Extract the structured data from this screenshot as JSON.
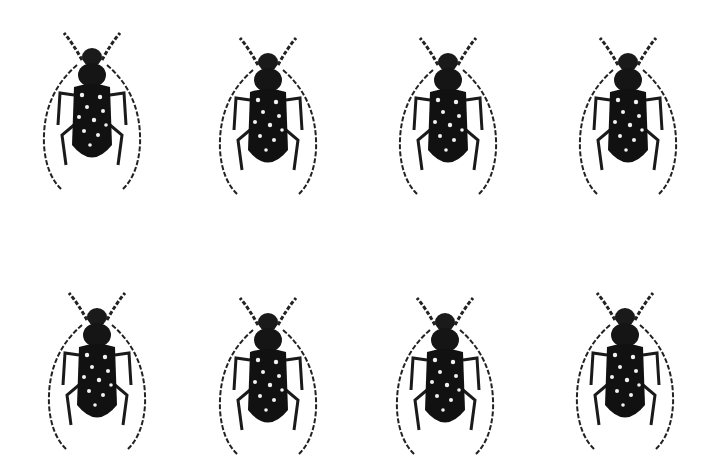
{
  "image": {
    "background": "#ffffff",
    "subject": "beetle specimens, dorsal view, black with white spots, long banded antennae",
    "layout": {
      "rows": 2,
      "columns": 4
    },
    "colors": {
      "body": "#111111",
      "spots": "#f2f2f2",
      "antenna": "#222222"
    }
  },
  "specimens": [
    {
      "row": 1,
      "col": 1,
      "x": 32,
      "y": 25
    },
    {
      "row": 1,
      "col": 2,
      "x": 208,
      "y": 30
    },
    {
      "row": 1,
      "col": 3,
      "x": 388,
      "y": 30
    },
    {
      "row": 1,
      "col": 4,
      "x": 568,
      "y": 30
    },
    {
      "row": 2,
      "col": 1,
      "x": 37,
      "y": 285
    },
    {
      "row": 2,
      "col": 2,
      "x": 208,
      "y": 290
    },
    {
      "row": 2,
      "col": 3,
      "x": 385,
      "y": 290
    },
    {
      "row": 2,
      "col": 4,
      "x": 565,
      "y": 285
    }
  ]
}
